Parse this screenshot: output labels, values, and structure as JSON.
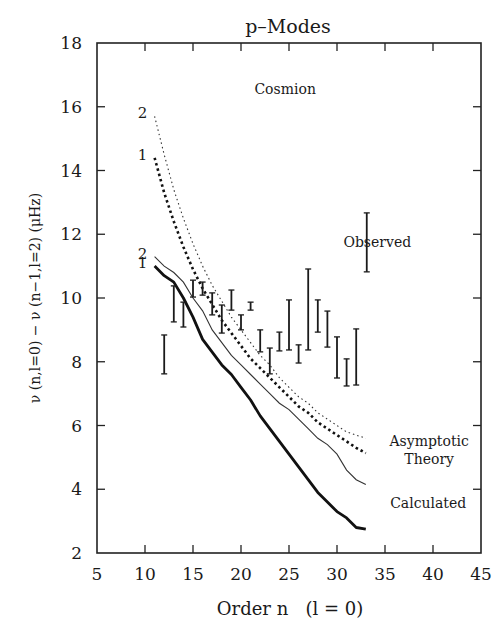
{
  "chart_data": {
    "type": "line",
    "title": "p–Modes",
    "xlabel": "Order n   (l = 0)",
    "ylabel": "ν (n,l=0) − ν (n−1,l=2)  (μHz)",
    "xlim": [
      5,
      45
    ],
    "ylim": [
      2,
      18
    ],
    "xticks": [
      5,
      10,
      15,
      20,
      25,
      30,
      35,
      40,
      45
    ],
    "yticks": [
      2,
      4,
      6,
      8,
      10,
      12,
      14,
      16,
      18
    ],
    "grid": false,
    "annotations": [
      {
        "text": "Cosmion",
        "x": 24.6,
        "y": 16.4
      },
      {
        "text": "Observed",
        "x": 34.2,
        "y": 11.6
      },
      {
        "text": "Asymptotic",
        "x": 39.6,
        "y": 5.35
      },
      {
        "text": "Theory",
        "x": 39.6,
        "y": 4.8
      },
      {
        "text": "Calculated",
        "x": 39.5,
        "y": 3.4
      }
    ],
    "x": [
      11,
      12,
      13,
      14,
      15,
      16,
      17,
      18,
      19,
      20,
      21,
      22,
      23,
      24,
      25,
      26,
      27,
      28,
      29,
      30,
      31,
      32,
      33
    ],
    "series": [
      {
        "name": "Asymptotic Theory (2)",
        "style": "thin-dotted",
        "curve_label": "2",
        "values": [
          15.7,
          14.5,
          13.4,
          12.5,
          11.7,
          11.0,
          10.4,
          9.9,
          9.4,
          9.0,
          8.6,
          8.2,
          7.9,
          7.5,
          7.2,
          6.9,
          6.7,
          6.4,
          6.2,
          6.0,
          5.8,
          5.7,
          5.6
        ]
      },
      {
        "name": "Asymptotic Theory (1)",
        "style": "thick-dotted",
        "curve_label": "1",
        "values": [
          14.4,
          13.3,
          12.4,
          11.6,
          10.9,
          10.3,
          9.8,
          9.3,
          8.9,
          8.5,
          8.1,
          7.8,
          7.5,
          7.2,
          6.9,
          6.6,
          6.4,
          6.1,
          5.9,
          5.7,
          5.5,
          5.3,
          5.13
        ]
      },
      {
        "name": "Calculated (2)",
        "style": "thin-solid",
        "curve_label": "2",
        "values": [
          11.3,
          11.0,
          10.8,
          10.5,
          10.0,
          9.6,
          9.0,
          8.6,
          8.2,
          7.9,
          7.6,
          7.3,
          7.0,
          6.7,
          6.5,
          6.2,
          5.9,
          5.6,
          5.4,
          5.1,
          4.6,
          4.3,
          4.15
        ]
      },
      {
        "name": "Calculated (1)",
        "style": "thick-solid",
        "curve_label": "1",
        "values": [
          11.0,
          10.7,
          10.5,
          10.0,
          9.4,
          8.7,
          8.3,
          7.9,
          7.6,
          7.2,
          6.8,
          6.3,
          5.9,
          5.5,
          5.1,
          4.7,
          4.3,
          3.9,
          3.6,
          3.3,
          3.1,
          2.8,
          2.75
        ]
      }
    ],
    "observed": {
      "name": "Observed",
      "type": "errorbar",
      "points": [
        {
          "n": 12,
          "low": 7.62,
          "high": 8.84
        },
        {
          "n": 13,
          "low": 9.25,
          "high": 10.38
        },
        {
          "n": 14,
          "low": 9.09,
          "high": 9.87
        },
        {
          "n": 15,
          "low": 10.03,
          "high": 10.56
        },
        {
          "n": 16,
          "low": 10.09,
          "high": 10.5
        },
        {
          "n": 17,
          "low": 9.47,
          "high": 10.16
        },
        {
          "n": 18,
          "low": 8.9,
          "high": 9.78
        },
        {
          "n": 19,
          "low": 9.62,
          "high": 10.25
        },
        {
          "n": 20,
          "low": 9.0,
          "high": 9.47
        },
        {
          "n": 21,
          "low": 9.62,
          "high": 9.87
        },
        {
          "n": 22,
          "low": 8.31,
          "high": 9.0
        },
        {
          "n": 23,
          "low": 7.62,
          "high": 8.43
        },
        {
          "n": 24,
          "low": 8.34,
          "high": 8.93
        },
        {
          "n": 25,
          "low": 8.37,
          "high": 9.94
        },
        {
          "n": 26,
          "low": 7.96,
          "high": 8.53
        },
        {
          "n": 27,
          "low": 8.37,
          "high": 10.91
        },
        {
          "n": 28,
          "low": 8.93,
          "high": 9.94
        },
        {
          "n": 29,
          "low": 8.46,
          "high": 9.59
        },
        {
          "n": 30,
          "low": 7.49,
          "high": 8.78
        },
        {
          "n": 31,
          "low": 7.24,
          "high": 8.09
        },
        {
          "n": 32,
          "low": 7.27,
          "high": 9.03
        }
      ],
      "legend_bar": {
        "n": 33.1,
        "low": 10.82,
        "high": 12.67
      }
    }
  }
}
